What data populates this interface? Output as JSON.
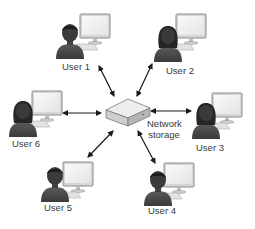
{
  "diagram": {
    "type": "network-topology",
    "center": {
      "id": "storage",
      "label_line1": "Network",
      "label_line2": "storage"
    },
    "nodes": [
      {
        "id": "user1",
        "label": "User 1"
      },
      {
        "id": "user2",
        "label": "User 2"
      },
      {
        "id": "user3",
        "label": "User 3"
      },
      {
        "id": "user4",
        "label": "User 4"
      },
      {
        "id": "user5",
        "label": "User 5"
      },
      {
        "id": "user6",
        "label": "User 6"
      }
    ],
    "edges": [
      {
        "from": "user1",
        "to": "storage",
        "bidirectional": true
      },
      {
        "from": "user2",
        "to": "storage",
        "bidirectional": true
      },
      {
        "from": "user3",
        "to": "storage",
        "bidirectional": true
      },
      {
        "from": "user4",
        "to": "storage",
        "bidirectional": true
      },
      {
        "from": "user5",
        "to": "storage",
        "bidirectional": true
      },
      {
        "from": "user6",
        "to": "storage",
        "bidirectional": true
      }
    ],
    "colors": {
      "person": "#4a4a4a",
      "hair": "#2a2a2a",
      "monitor_frame": "#9a9a9a",
      "monitor_screen": "#f2f2f2",
      "storage_top": "#e6e6e6",
      "storage_side": "#bdbdbd",
      "arrow": "#1a1a1a"
    }
  }
}
